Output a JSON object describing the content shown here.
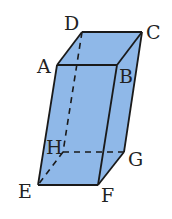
{
  "diagram": {
    "type": "parallelepiped",
    "fill_color": "#8fb8e8",
    "edge_color": "#1a1a1a",
    "vertices": {
      "A": {
        "label": "A",
        "x": 57,
        "y": 65
      },
      "B": {
        "label": "B",
        "x": 117,
        "y": 65
      },
      "C": {
        "label": "C",
        "x": 142,
        "y": 32
      },
      "D": {
        "label": "D",
        "x": 82,
        "y": 32
      },
      "E": {
        "label": "E",
        "x": 38,
        "y": 185
      },
      "F": {
        "label": "F",
        "x": 98,
        "y": 185
      },
      "G": {
        "label": "G",
        "x": 124,
        "y": 152
      },
      "H": {
        "label": "H",
        "x": 63,
        "y": 152
      }
    },
    "visible_edges": [
      "AB",
      "BC",
      "CD",
      "DA",
      "AE",
      "BF",
      "CG",
      "EF",
      "FG"
    ],
    "hidden_edges": [
      "DH",
      "HE",
      "HG"
    ],
    "labels": {
      "A": "A",
      "B": "B",
      "C": "C",
      "D": "D",
      "E": "E",
      "F": "F",
      "G": "G",
      "H": "H"
    }
  }
}
